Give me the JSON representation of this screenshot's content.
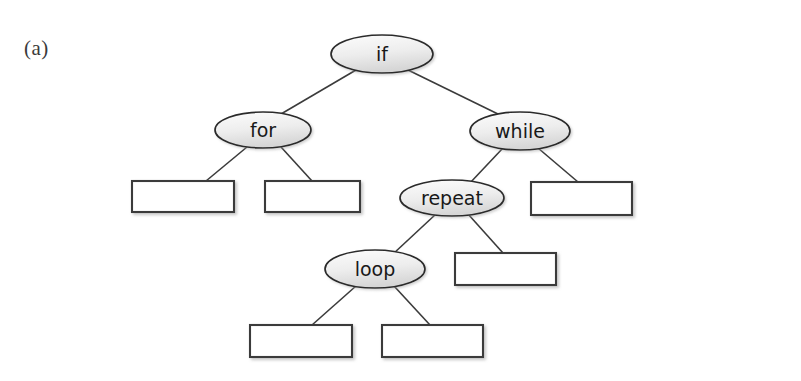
{
  "figure": {
    "panel_label": "(a)",
    "background_color": "#ffffff",
    "node_fill_light": "#fbfbfb",
    "node_fill_dark": "#d9d9d9",
    "node_stroke_color": "#2b2b2b",
    "edge_color": "#3b3b3b",
    "box_stroke_color": "#3a3a3a",
    "box_fill_color": "#ffffff"
  },
  "tree": {
    "labeled_nodes": [
      {
        "id": "if",
        "label": "if",
        "cx": 382,
        "cy": 54,
        "rx": 51,
        "ry": 19
      },
      {
        "id": "for",
        "label": "for",
        "cx": 263,
        "cy": 130,
        "rx": 48,
        "ry": 18
      },
      {
        "id": "while",
        "label": "while",
        "cx": 520,
        "cy": 131,
        "rx": 50,
        "ry": 19
      },
      {
        "id": "repeat",
        "label": "repeat",
        "cx": 452,
        "cy": 198,
        "rx": 52,
        "ry": 18
      },
      {
        "id": "loop",
        "label": "loop",
        "cx": 375,
        "cy": 269,
        "rx": 50,
        "ry": 19
      }
    ],
    "leaf_boxes": [
      {
        "id": "leaf-for-left",
        "x": 132,
        "y": 181,
        "w": 102,
        "h": 31
      },
      {
        "id": "leaf-for-right",
        "x": 265,
        "y": 181,
        "w": 95,
        "h": 31
      },
      {
        "id": "leaf-while-right",
        "x": 531,
        "y": 182,
        "w": 101,
        "h": 33
      },
      {
        "id": "leaf-repeat-right",
        "x": 455,
        "y": 253,
        "w": 101,
        "h": 32
      },
      {
        "id": "leaf-loop-left",
        "x": 250,
        "y": 325,
        "w": 102,
        "h": 32
      },
      {
        "id": "leaf-loop-right",
        "x": 382,
        "y": 325,
        "w": 101,
        "h": 32
      }
    ],
    "edges": [
      {
        "id": "if-for",
        "from": "if",
        "to": "for",
        "x1": 356,
        "y1": 70,
        "x2": 281,
        "y2": 114
      },
      {
        "id": "if-while",
        "from": "if",
        "to": "while",
        "x1": 408,
        "y1": 70,
        "x2": 500,
        "y2": 115
      },
      {
        "id": "for-leaf-left",
        "from": "for",
        "to": "leaf-for-left",
        "x1": 247,
        "y1": 147,
        "x2": 206,
        "y2": 181
      },
      {
        "id": "for-leaf-right",
        "from": "for",
        "to": "leaf-for-right",
        "x1": 281,
        "y1": 147,
        "x2": 312,
        "y2": 181
      },
      {
        "id": "while-repeat",
        "from": "while",
        "to": "repeat",
        "x1": 503,
        "y1": 148,
        "x2": 469,
        "y2": 184
      },
      {
        "id": "while-leaf-right",
        "from": "while",
        "to": "leaf-while-right",
        "x1": 538,
        "y1": 148,
        "x2": 578,
        "y2": 182
      },
      {
        "id": "repeat-loop",
        "from": "repeat",
        "to": "loop",
        "x1": 436,
        "y1": 214,
        "x2": 393,
        "y2": 254
      },
      {
        "id": "repeat-leaf-right",
        "from": "repeat",
        "to": "leaf-repeat-right",
        "x1": 468,
        "y1": 214,
        "x2": 503,
        "y2": 253
      },
      {
        "id": "loop-leaf-left",
        "from": "loop",
        "to": "leaf-loop-left",
        "x1": 356,
        "y1": 286,
        "x2": 312,
        "y2": 325
      },
      {
        "id": "loop-leaf-right",
        "from": "loop",
        "to": "leaf-loop-right",
        "x1": 394,
        "y1": 286,
        "x2": 430,
        "y2": 325
      }
    ]
  }
}
